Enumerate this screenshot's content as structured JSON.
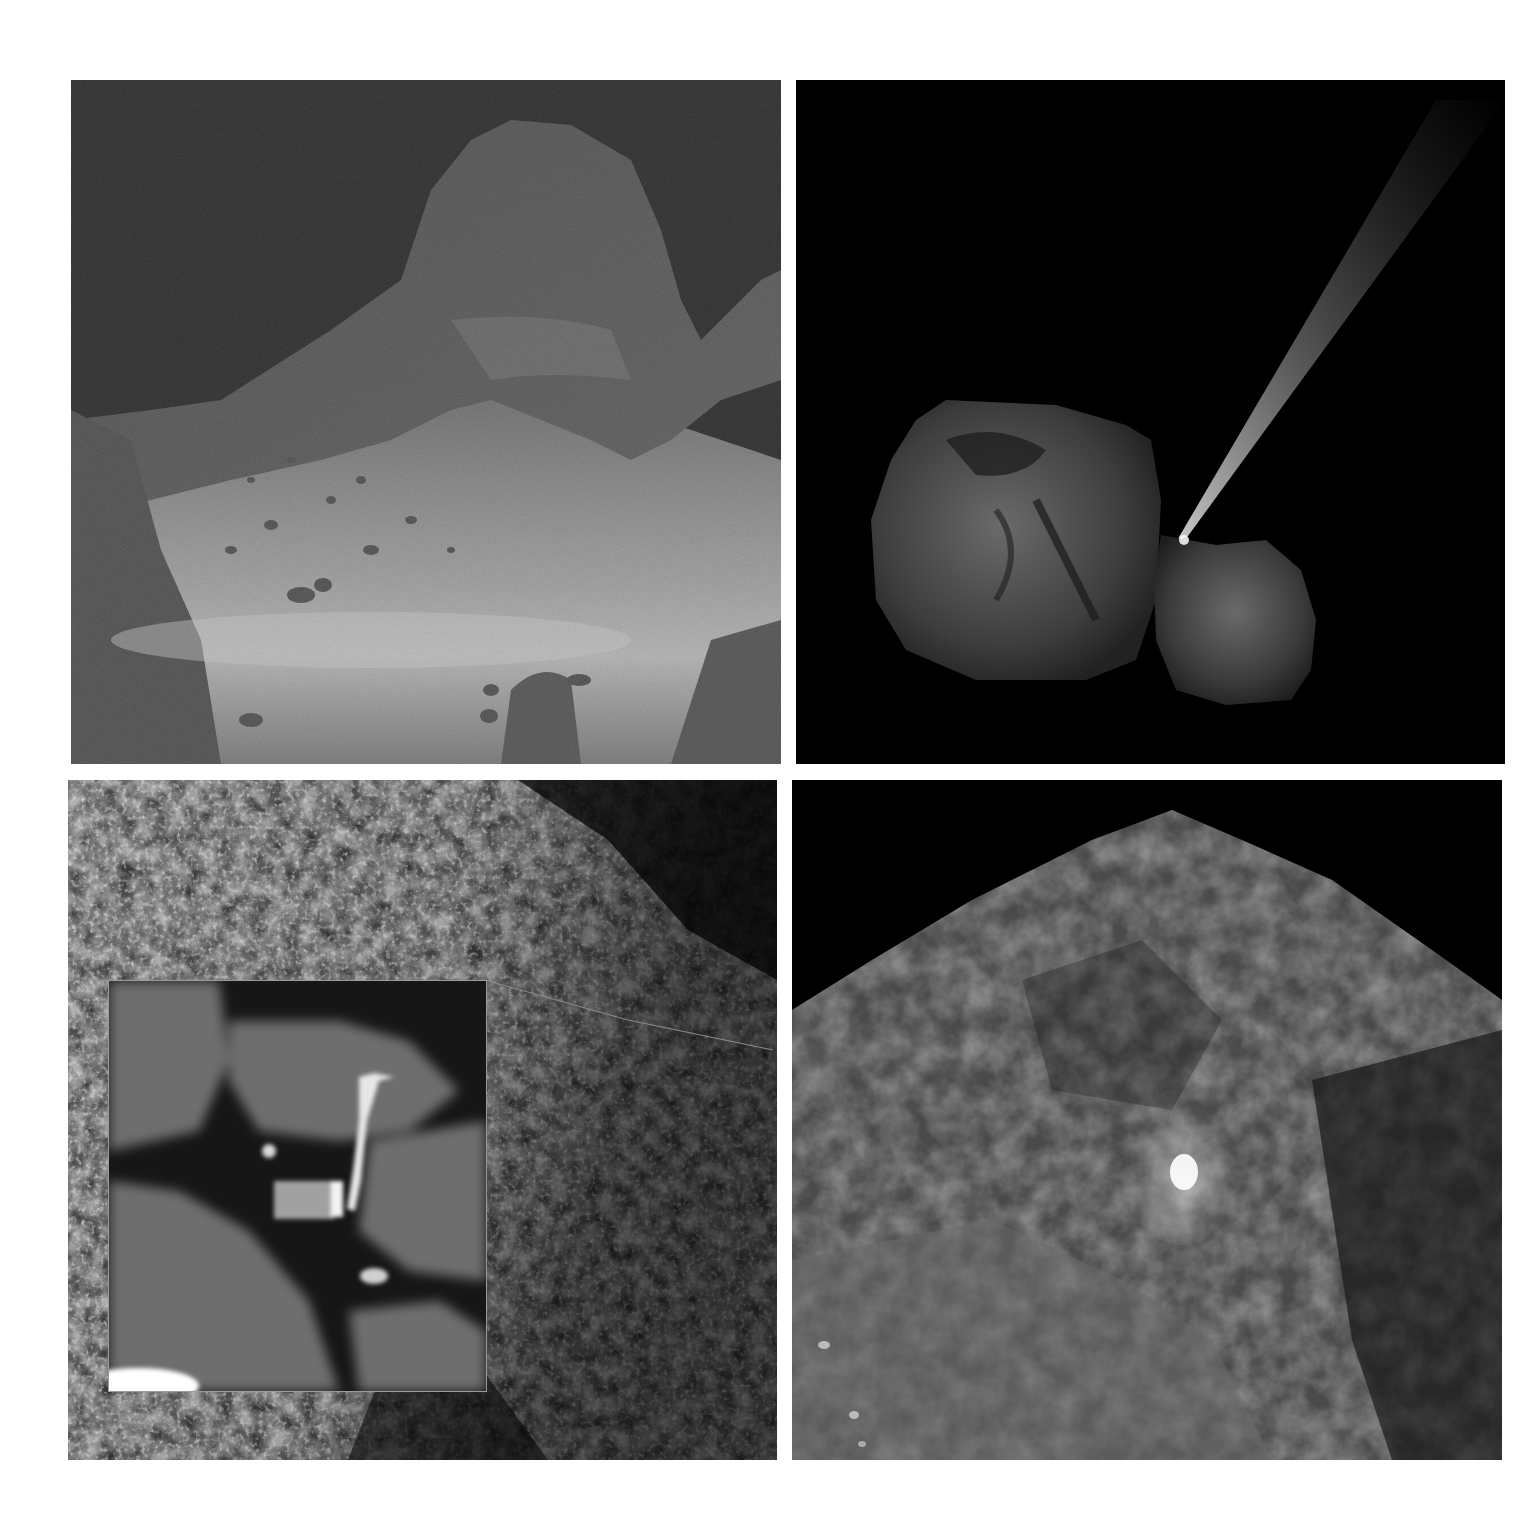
{
  "figure": {
    "layout": "2x2 grid",
    "background": "#ffffff",
    "panels": [
      {
        "id": "top-left",
        "description": "Close-up of comet surface: dark rocky cliff and peak against black sky, with a bright dusty boulder-strewn slope below",
        "dominant_colors": [
          "#000000",
          "#3a3a3a",
          "#8a8a8a"
        ]
      },
      {
        "id": "top-right",
        "description": "Two-lobed comet nucleus against black space with a bright dust jet streaming diagonally up-right from the neck",
        "dominant_colors": [
          "#000000",
          "#4a4a4a",
          "#9a9a9a"
        ]
      },
      {
        "id": "bottom-left",
        "description": "Rough, rubbly comet terrain with a magnified inset showing a lander wedged in a shadowed crevice",
        "dominant_colors": [
          "#2a2a2a",
          "#7a7a7a",
          "#cfcfcf"
        ],
        "inset": {
          "description": "Enlarged view of lander body with bright leg and boom among blurry boulders"
        }
      },
      {
        "id": "bottom-right",
        "description": "Comet cliff terrain with a small bright outburst plume near the lower center",
        "dominant_colors": [
          "#000000",
          "#3c3c3c",
          "#6e6e6e",
          "#ffffff"
        ]
      }
    ]
  }
}
